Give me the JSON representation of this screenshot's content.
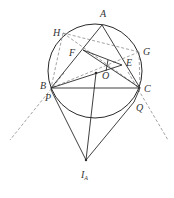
{
  "figure": {
    "type": "geometry-diagram",
    "circle": {
      "cx": 95,
      "cy": 71,
      "r": 47
    },
    "points": {
      "A": {
        "label": "A",
        "x": 102,
        "y": 25,
        "lx": 100,
        "ly": 17
      },
      "H": {
        "label": "H",
        "x": 63,
        "y": 33,
        "lx": 53,
        "ly": 36
      },
      "G": {
        "label": "G",
        "x": 139,
        "y": 52,
        "lx": 143,
        "ly": 55
      },
      "F": {
        "label": "F",
        "x": 83,
        "y": 50,
        "lx": 69,
        "ly": 56
      },
      "E": {
        "label": "E",
        "x": 122,
        "y": 65,
        "lx": 126,
        "ly": 66
      },
      "O": {
        "label": "O",
        "x": 96,
        "y": 73,
        "lx": 102,
        "ly": 79
      },
      "B": {
        "label": "B",
        "x": 51,
        "y": 88,
        "lx": 41,
        "ly": 88
      },
      "C": {
        "label": "C",
        "x": 140,
        "y": 88,
        "lx": 144,
        "ly": 91
      },
      "P": {
        "label": "P",
        "x": 52,
        "y": 92,
        "lx": 45,
        "ly": 101
      },
      "Q": {
        "label": "Q",
        "x": 134,
        "y": 102,
        "lx": 136,
        "ly": 110
      },
      "IA": {
        "label": "I",
        "sub": "A",
        "x": 86,
        "y": 160,
        "lx": 81,
        "ly": 178
      }
    },
    "labels": [
      "A",
      "H",
      "G",
      "F",
      "E",
      "O",
      "B",
      "C",
      "P",
      "Q",
      "I",
      "A"
    ],
    "stroke_color": "#2a2a2a",
    "dash_color": "#7a7a7a"
  }
}
